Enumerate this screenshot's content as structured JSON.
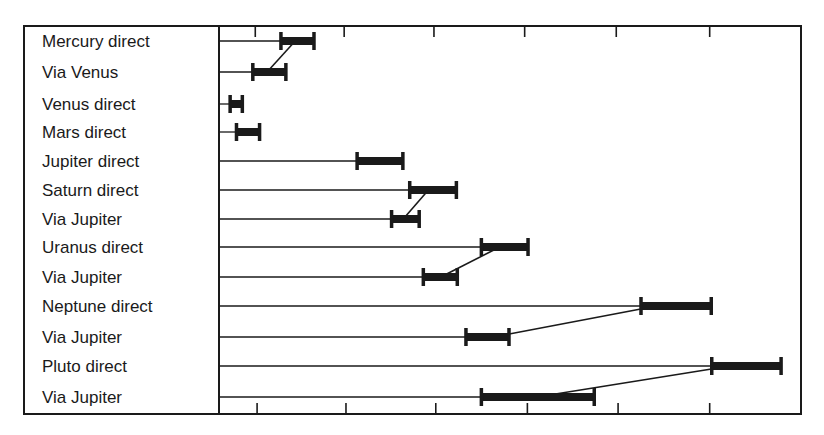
{
  "chart_data": {
    "type": "bar",
    "subtype": "range-bar (floating horizontal bars with connectors)",
    "title": "",
    "xlabel": "",
    "ylabel": "",
    "grid": false,
    "legend": null,
    "x_axis": {
      "origin_px": 219,
      "unit_px": 90.7,
      "tick_labels": [],
      "top_ticks_units": [
        0.4,
        1.38,
        2.37,
        3.37,
        4.38,
        5.41
      ],
      "bottom_ticks_units": [
        0.42,
        1.4,
        2.39,
        3.4,
        4.4,
        5.41
      ],
      "xlim_units": [
        0,
        6.42
      ]
    },
    "categories": [
      "Mercury direct",
      "Via Venus",
      "Venus direct",
      "Mars direct",
      "Jupiter direct",
      "Saturn direct",
      "Via Jupiter",
      "Uranus direct",
      "Via Jupiter",
      "Neptune direct",
      "Via Jupiter",
      "Pluto direct",
      "Via Jupiter"
    ],
    "series": [
      {
        "name": "range",
        "values": [
          {
            "start": 0.68,
            "end": 1.05
          },
          {
            "start": 0.37,
            "end": 0.74
          },
          {
            "start": 0.12,
            "end": 0.26
          },
          {
            "start": 0.19,
            "end": 0.45
          },
          {
            "start": 1.52,
            "end": 2.03
          },
          {
            "start": 2.1,
            "end": 2.62
          },
          {
            "start": 1.9,
            "end": 2.21
          },
          {
            "start": 2.89,
            "end": 3.41
          },
          {
            "start": 2.25,
            "end": 2.63
          },
          {
            "start": 4.65,
            "end": 5.43
          },
          {
            "start": 2.72,
            "end": 3.2
          },
          {
            "start": 5.43,
            "end": 6.2
          },
          {
            "start": 2.89,
            "end": 4.14
          }
        ]
      }
    ],
    "connectors": [
      {
        "from_row": 1,
        "from_x": 0.56,
        "to_row": 0,
        "to_x": 0.81
      },
      {
        "from_row": 6,
        "from_x": 2.06,
        "to_row": 5,
        "to_x": 2.28
      },
      {
        "from_row": 8,
        "from_x": 2.51,
        "to_row": 7,
        "to_x": 3.03
      },
      {
        "from_row": 10,
        "from_x": 3.2,
        "to_row": 9,
        "to_x": 4.65
      },
      {
        "from_row": 12,
        "from_x": 3.71,
        "to_row": 11,
        "to_x": 5.43
      }
    ],
    "colors": {
      "ink": "#1a1a1a",
      "background": "#ffffff"
    }
  }
}
